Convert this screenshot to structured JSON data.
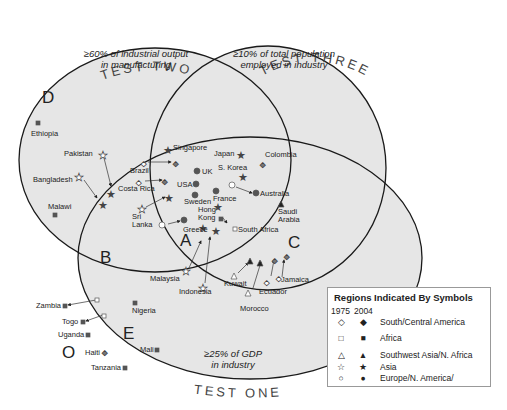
{
  "diagram": {
    "type": "venn",
    "tests": [
      {
        "id": "test-one",
        "label": "TEST ONE",
        "criterion_line1": "≥25% of GDP",
        "criterion_line2": "in industry"
      },
      {
        "id": "test-two",
        "label": "TEST TWO",
        "criterion_line1": "≥60% of industrial output",
        "criterion_line2": "in manufacturing"
      },
      {
        "id": "test-three",
        "label": "TEST THREE",
        "criterion_line1": "≥10% of total population",
        "criterion_line2": "employed in industry"
      }
    ],
    "regions": {
      "A": "A",
      "B": "B",
      "C": "C",
      "D": "D",
      "E": "E",
      "O": "O"
    },
    "countries": {
      "ethiopia": "Ethiopia",
      "pakistan": "Pakistan",
      "bangladesh": "Bangladesh",
      "malawi": "Malawi",
      "brazil": "Brazil",
      "costa_rica": "Costa Rica",
      "sri": "Sri",
      "lanka": "Lanka",
      "singapore": "Singapore",
      "uk": "UK",
      "usa": "USA",
      "sweden": "Sweden",
      "france": "France",
      "hong": "Hong",
      "kong": "Kong",
      "greece": "Greece",
      "japan": "Japan",
      "s_korea": "S. Korea",
      "colombia": "Colombia",
      "australia": "Australia",
      "saudi": "Saudi",
      "arabia": "Arabia",
      "south_africa": "South Africa",
      "malaysia": "Malaysia",
      "indonesia": "Indonesia",
      "kuwait": "Kuwait",
      "morocco": "Morocco",
      "ecuador": "Ecuador",
      "jamaica": "Jamaica",
      "nigeria": "Nigeria",
      "mali": "Mali",
      "zambia": "Zambia",
      "togo": "Togo",
      "uganda": "Uganda",
      "haiti": "Haiti",
      "tanzania": "Tanzania"
    }
  },
  "legend": {
    "title": "Regions Indicated By Symbols",
    "year_1975": "1975",
    "year_2004": "2004",
    "rows": [
      {
        "label": "South/Central America",
        "sym1975": "◇",
        "sym2004": "◆",
        "icon": "diamond-icon"
      },
      {
        "label": "Africa",
        "sym1975": "□",
        "sym2004": "■",
        "icon": "square-icon"
      },
      {
        "label": "Southwest Asia/N. Africa",
        "sym1975": "△",
        "sym2004": "▲",
        "icon": "triangle-icon"
      },
      {
        "label": "Asia",
        "sym1975": "☆",
        "sym2004": "★",
        "icon": "star-icon"
      },
      {
        "label": "Europe/N. America/",
        "label2": "Australasia",
        "sym1975": "○",
        "sym2004": "●",
        "icon": "circle-icon"
      }
    ]
  },
  "colors": {
    "fill": "#e6e6e6",
    "stroke": "#1a1a1a",
    "marker": "#555555",
    "text": "#222222"
  }
}
